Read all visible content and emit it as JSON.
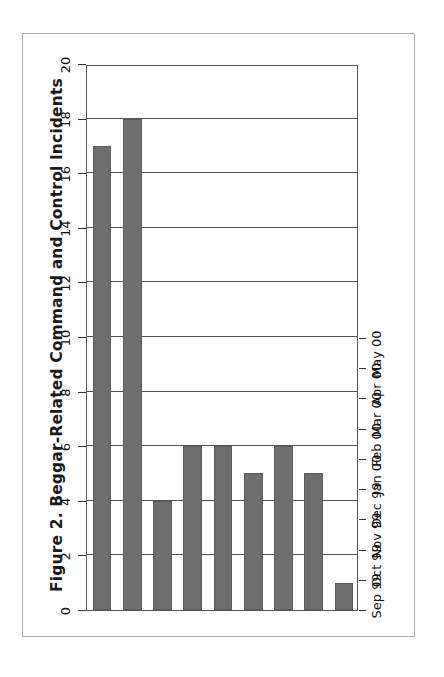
{
  "figure": {
    "title": "Figure 2. Beggar-Related Command and Control Incidents",
    "frame_color": "#aeaeae",
    "bar_color": "#6e6e6e",
    "axis_color": "#555555",
    "background": "#ffffff",
    "orientation": "rotated-90-ccw"
  },
  "chart_data": {
    "type": "bar",
    "title": "Figure 2. Beggar-Related Command and Control Incidents",
    "xlabel": "",
    "ylabel": "",
    "categories": [
      "Sep 99",
      "Oct 99",
      "Nov 99",
      "Dec 99",
      "Jan 00",
      "Feb 00",
      "Mar 00",
      "Apr 00",
      "May 00"
    ],
    "values": [
      17,
      18,
      4,
      6,
      6,
      5,
      6,
      5,
      1
    ],
    "ylim": [
      0,
      20
    ],
    "tick_values": [
      20,
      18,
      16,
      14,
      12,
      10,
      8,
      6,
      4,
      2,
      0
    ],
    "tick_labels": [
      "20",
      "18",
      "16",
      "14",
      "12",
      "10",
      "8",
      "6",
      "4",
      "2",
      "0"
    ],
    "grid": true,
    "legend": null,
    "legend_position": "none",
    "series": [
      {
        "name": "Incidents",
        "values": [
          17,
          18,
          4,
          6,
          6,
          5,
          6,
          5,
          1
        ]
      }
    ]
  }
}
